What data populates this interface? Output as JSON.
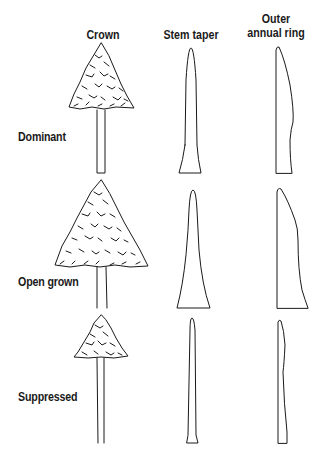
{
  "headers": {
    "crown": "Crown",
    "stem_taper": "Stem taper",
    "outer_ring_line1": "Outer",
    "outer_ring_line2": "annual ring"
  },
  "rows": [
    {
      "label": "Dominant"
    },
    {
      "label": "Open grown"
    },
    {
      "label": "Suppressed"
    }
  ],
  "colors": {
    "ink": "#1a1a1a",
    "background": "#ffffff"
  }
}
